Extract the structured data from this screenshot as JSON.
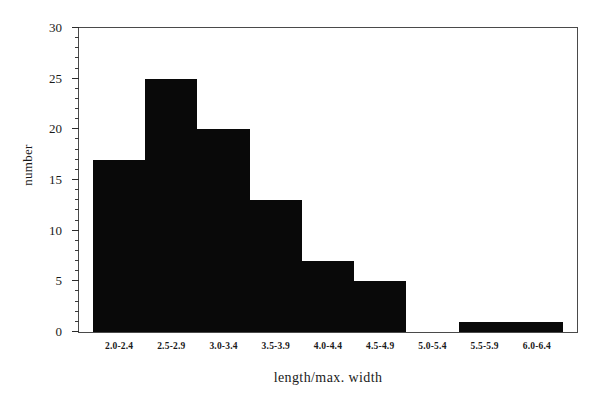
{
  "chart_data": {
    "type": "bar",
    "title": "",
    "xlabel": "length/max. width",
    "ylabel": "number",
    "categories": [
      "2.0-2.4",
      "2.5-2.9",
      "3.0-3.4",
      "3.5-3.9",
      "4.0-4.4",
      "4.5-4.9",
      "5.0-5.4",
      "5.5-5.9",
      "6.0-6.4"
    ],
    "values": [
      17,
      25,
      20,
      13,
      7,
      5,
      0,
      1,
      1
    ],
    "ylim": [
      0,
      30
    ],
    "ytick_major": [
      0,
      5,
      10,
      15,
      20,
      25,
      30
    ],
    "ytick_labels": [
      "0",
      "5",
      "10",
      "15",
      "20",
      "25",
      "30"
    ],
    "ytick_minor_step": 1,
    "grid": false,
    "legend": false,
    "bar_color": "#090909",
    "axis_color": "#4a4a4a",
    "background": "#ffffff"
  }
}
